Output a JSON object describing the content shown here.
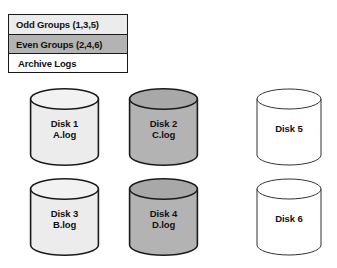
{
  "legend": {
    "name": "disk-group-legend",
    "rows": [
      {
        "label": "Odd Groups (1,3,5)",
        "fill": "#ececec",
        "swatch_name": "odd-groups"
      },
      {
        "label": "Even Groups (2,4,6)",
        "fill": "#b3b3b3",
        "swatch_name": "even-groups"
      },
      {
        "label": "Archive Logs",
        "fill": "#ffffff",
        "swatch_name": "archive-logs"
      }
    ]
  },
  "disks": [
    {
      "id": "disk-1",
      "name": "Disk 1",
      "file": "A.log",
      "fill": "#ececec",
      "top_fill": "#f2f2f2",
      "stroke": "#1a1a1a",
      "stroke_width": 1.6,
      "column": 1,
      "row": 1
    },
    {
      "id": "disk-2",
      "name": "Disk 2",
      "file": "C.log",
      "fill": "#b3b3b3",
      "top_fill": "#a8a8a8",
      "stroke": "#1a1a1a",
      "stroke_width": 1.6,
      "column": 2,
      "row": 1
    },
    {
      "id": "disk-5",
      "name": "Disk 5",
      "file": "",
      "fill": "#ffffff",
      "top_fill": "#ffffff",
      "stroke": "#333333",
      "stroke_width": 1.0,
      "column": 3,
      "row": 1
    },
    {
      "id": "disk-3",
      "name": "Disk 3",
      "file": "B.log",
      "fill": "#ececec",
      "top_fill": "#f2f2f2",
      "stroke": "#1a1a1a",
      "stroke_width": 1.6,
      "column": 1,
      "row": 2
    },
    {
      "id": "disk-4",
      "name": "Disk 4",
      "file": "D.log",
      "fill": "#b3b3b3",
      "top_fill": "#a8a8a8",
      "stroke": "#1a1a1a",
      "stroke_width": 1.6,
      "column": 2,
      "row": 2
    },
    {
      "id": "disk-6",
      "name": "Disk 6",
      "file": "",
      "fill": "#ffffff",
      "top_fill": "#ffffff",
      "stroke": "#333333",
      "stroke_width": 1.0,
      "column": 3,
      "row": 2
    }
  ],
  "colors": {
    "background": "#ffffff",
    "outline": "#1a1a1a",
    "odd_group": "#ececec",
    "even_group": "#b3b3b3",
    "archive": "#ffffff",
    "text": "#111111"
  }
}
